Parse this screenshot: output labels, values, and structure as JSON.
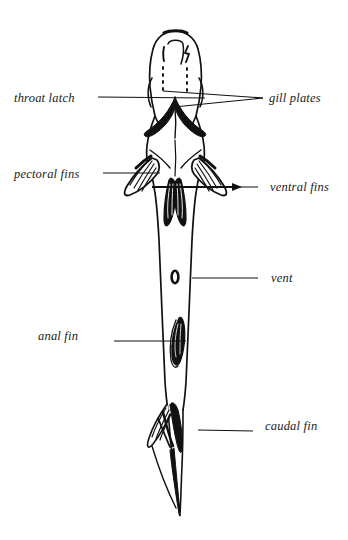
{
  "figure": {
    "background_color": "#ffffff",
    "ink_color": "#111111",
    "annotations": [
      {
        "id": "throat-latch",
        "label": "throat latch",
        "side": "left",
        "label_x": 14,
        "label_y": 92,
        "leader": {
          "x1": 98,
          "y1": 97,
          "x2": 205,
          "y2": 98
        }
      },
      {
        "id": "gill-plates",
        "label": "gill plates",
        "side": "right",
        "label_x": 269,
        "label_y": 92,
        "leader": {
          "x1": 263,
          "y1": 98,
          "x2": 163,
          "y2": 91
        },
        "leader2": {
          "x1": 263,
          "y1": 98,
          "x2": 174,
          "y2": 107
        }
      },
      {
        "id": "pectoral-fins",
        "label": "pectoral fins",
        "side": "left",
        "label_x": 14,
        "label_y": 168,
        "leader": {
          "x1": 103,
          "y1": 173,
          "x2": 160,
          "y2": 173
        }
      },
      {
        "id": "ventral-fins",
        "label": "ventral fins",
        "side": "right",
        "label_x": 270,
        "label_y": 181,
        "leader": {
          "x1": 258,
          "y1": 187,
          "x2": 190,
          "y2": 187
        },
        "arrow": true
      },
      {
        "id": "vent",
        "label": "vent",
        "side": "right",
        "label_x": 271,
        "label_y": 272,
        "leader": {
          "x1": 258,
          "y1": 278,
          "x2": 192,
          "y2": 278
        }
      },
      {
        "id": "anal-fin",
        "label": "anal fin",
        "side": "left",
        "label_x": 38,
        "label_y": 330,
        "leader": {
          "x1": 114,
          "y1": 341,
          "x2": 186,
          "y2": 341
        }
      },
      {
        "id": "caudal-fin",
        "label": "caudal fin",
        "side": "right",
        "label_x": 265,
        "label_y": 420,
        "leader": {
          "x1": 253,
          "y1": 431,
          "x2": 198,
          "y2": 430
        }
      }
    ],
    "fish_parts": [
      "head",
      "throat-latch",
      "gill-plates",
      "pectoral-fin-left",
      "pectoral-fin-right",
      "ventral-fin-left",
      "ventral-fin-right",
      "body",
      "vent",
      "anal-fin",
      "caudal-fin"
    ]
  }
}
